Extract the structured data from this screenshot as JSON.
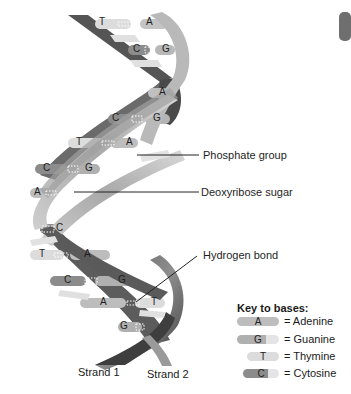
{
  "labels": {
    "phosphate": "Phosphate group",
    "sugar": "Deoxyribose sugar",
    "hbond": "Hydrogen bond"
  },
  "strands": {
    "strand1": "Strand 1",
    "strand2": "Strand 2"
  },
  "key": {
    "title": "Key to bases:",
    "items": [
      {
        "base": "A",
        "name": "= Adenine",
        "color": "#bdbdbd"
      },
      {
        "base": "G",
        "name": "= Guanine",
        "color": "#b0b0b0"
      },
      {
        "base": "T",
        "name": "= Thymine",
        "color": "#dcdcdc"
      },
      {
        "base": "C",
        "name": "= Cytosine",
        "color": "#8c8c8c"
      }
    ]
  },
  "base_pairs": [
    {
      "left": "T",
      "right": "A"
    },
    {
      "left": "C",
      "right": "G"
    },
    {
      "left": "",
      "right": "A"
    },
    {
      "left": "C",
      "right": "G"
    },
    {
      "left": "T",
      "right": "A"
    },
    {
      "left": "C",
      "right": "G"
    },
    {
      "left": "A",
      "right": ""
    },
    {
      "left": "",
      "right": "C"
    },
    {
      "left": "T",
      "right": "A"
    },
    {
      "left": "C",
      "right": "G"
    },
    {
      "left": "A",
      "right": "T"
    },
    {
      "left": "G",
      "right": ""
    }
  ],
  "colors": {
    "strand_dark": "#4a4a4a",
    "strand_mid": "#8a8a8a",
    "strand_light": "#d4d4d4",
    "leader": "#222222"
  }
}
